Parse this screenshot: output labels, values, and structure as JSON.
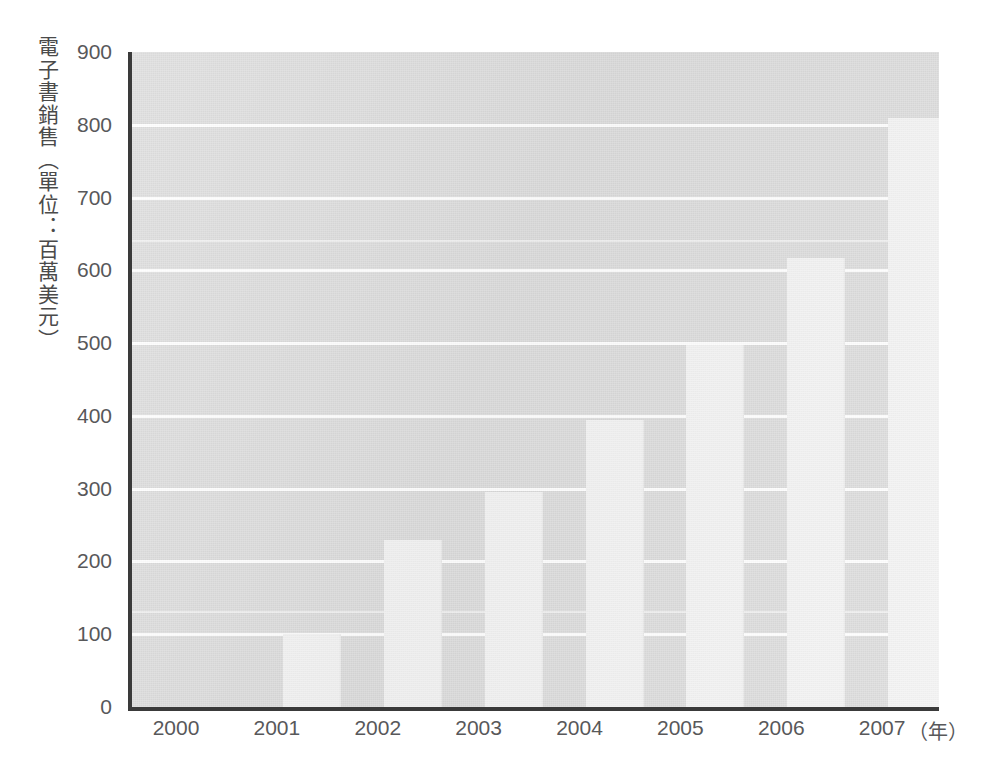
{
  "chart_data": {
    "type": "bar",
    "title": "",
    "subtitle": "",
    "xlabel": "（年）",
    "ylabel": "電子書銷售（單位：百萬美元）",
    "categories": [
      "2000",
      "2001",
      "2002",
      "2003",
      "2004",
      "2005",
      "2006",
      "2007"
    ],
    "values": [
      0,
      100,
      230,
      295,
      395,
      497,
      617,
      810
    ],
    "ylim": [
      0,
      900
    ],
    "ytick_step": 100,
    "ytick_labels": [
      "900",
      "800",
      "700",
      "600",
      "500",
      "400",
      "300",
      "200",
      "100",
      "0"
    ],
    "xtick_labels": [
      "2000",
      "2001",
      "2002",
      "2003",
      "2004",
      "2005",
      "2006",
      "2007"
    ],
    "grid": true,
    "grid_axis": "y",
    "legend": false,
    "legend_position": "none",
    "series": [
      {
        "name": "電子書銷售",
        "values": [
          0,
          100,
          230,
          295,
          395,
          497,
          617,
          810
        ]
      }
    ],
    "annotations": []
  },
  "axes": {
    "y_title": "電子書銷售（單位：百萬美元）",
    "x_unit_label": "（年）"
  },
  "colors": {
    "plot_background": "#dcdcdc",
    "bar_fill": "#f3f3f3",
    "gridline": "#ffffff",
    "axis_line": "#3a3a3a",
    "tick_text": "#58585a",
    "page_background": "#ffffff"
  }
}
